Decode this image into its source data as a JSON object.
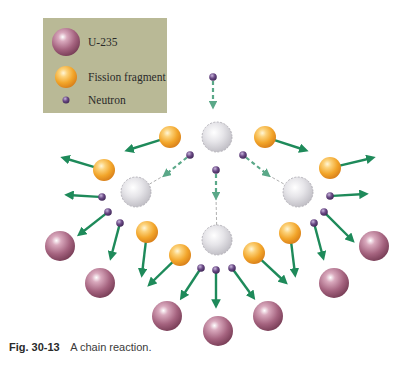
{
  "title": "A chain reaction",
  "legend": {
    "items": [
      {
        "label": "U-235",
        "type": "u235"
      },
      {
        "label": "Fission fragment",
        "type": "fragment"
      },
      {
        "label": "Neutron",
        "type": "neutron"
      }
    ],
    "background": "#b9b996"
  },
  "caption": {
    "figure_number": "Fig. 30-13",
    "text": "A chain reaction."
  },
  "colors": {
    "u235": "#a5637f",
    "fragment": "#f2a52a",
    "neutron": "#6b4a86",
    "splitting_nucleus": "#d9d8dc",
    "arrow": "#1e8a5a"
  },
  "diagram": {
    "generations": 3,
    "splitting_nuclei": [
      {
        "x": 217,
        "y": 137
      },
      {
        "x": 136,
        "y": 192
      },
      {
        "x": 298,
        "y": 192
      },
      {
        "x": 217,
        "y": 240
      }
    ],
    "fragments": [
      {
        "x": 170,
        "y": 137,
        "to": [
          128,
          150
        ]
      },
      {
        "x": 265,
        "y": 137,
        "to": [
          305,
          150
        ]
      },
      {
        "x": 104,
        "y": 170,
        "to": [
          64,
          158
        ]
      },
      {
        "x": 330,
        "y": 168,
        "to": [
          372,
          158
        ]
      },
      {
        "x": 147,
        "y": 232,
        "to": [
          142,
          274
        ]
      },
      {
        "x": 290,
        "y": 233,
        "to": [
          295,
          274
        ]
      },
      {
        "x": 180,
        "y": 255,
        "to": [
          150,
          284
        ]
      },
      {
        "x": 254,
        "y": 253,
        "to": [
          285,
          282
        ]
      }
    ],
    "incident_neutrons": [
      {
        "x": 213,
        "y": 77,
        "to": [
          213,
          106
        ]
      },
      {
        "x": 190,
        "y": 155,
        "to": [
          165,
          175
        ],
        "target": [
          136,
          192
        ]
      },
      {
        "x": 243,
        "y": 155,
        "to": [
          268,
          175
        ],
        "target": [
          298,
          192
        ]
      },
      {
        "x": 216,
        "y": 170,
        "to": [
          216,
          197
        ],
        "target": [
          217,
          240
        ]
      }
    ],
    "released_neutrons": [
      {
        "x": 102,
        "y": 197,
        "to": [
          68,
          195
        ]
      },
      {
        "x": 108,
        "y": 212,
        "to": [
          80,
          234
        ]
      },
      {
        "x": 120,
        "y": 223,
        "to": [
          111,
          257
        ]
      },
      {
        "x": 330,
        "y": 196,
        "to": [
          365,
          194
        ]
      },
      {
        "x": 324,
        "y": 212,
        "to": [
          352,
          240
        ]
      },
      {
        "x": 314,
        "y": 223,
        "to": [
          323,
          257
        ]
      },
      {
        "x": 201,
        "y": 268,
        "to": [
          182,
          297
        ]
      },
      {
        "x": 216,
        "y": 270,
        "to": [
          216,
          305
        ]
      },
      {
        "x": 232,
        "y": 268,
        "to": [
          253,
          297
        ]
      }
    ],
    "u235_targets": [
      {
        "x": 60,
        "y": 246
      },
      {
        "x": 100,
        "y": 283
      },
      {
        "x": 167,
        "y": 316
      },
      {
        "x": 218,
        "y": 331
      },
      {
        "x": 268,
        "y": 316
      },
      {
        "x": 334,
        "y": 283
      },
      {
        "x": 374,
        "y": 246
      }
    ]
  }
}
